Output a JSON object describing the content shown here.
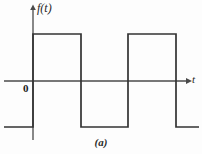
{
  "figure": {
    "caption": "(a)",
    "background_color": "#fdfdfd",
    "stroke_color": "#333333",
    "axis_color": "#4a4a4a",
    "width": 202,
    "height": 154
  },
  "axes": {
    "y_axis_label": "f(t)",
    "x_axis_label": "t",
    "origin_label": "0",
    "x_axis_y_px": 81,
    "y_axis_x_px": 33,
    "x_axis_start_px": 4,
    "x_axis_end_px": 188,
    "y_axis_top_px": 5,
    "y_axis_bottom_px": 140
  },
  "chart_data": {
    "type": "line",
    "title": "",
    "subtitle": "",
    "xlabel": "t",
    "ylabel": "f(t)",
    "legend": [],
    "legend_position": "none",
    "grid": false,
    "annotations": [
      "0",
      "(a)"
    ],
    "waveform": "square",
    "amplitude_high": 1,
    "amplitude_low": -1,
    "period_px": 95,
    "duty_cycle": 0.5,
    "xlim": [
      -0.35,
      1.8
    ],
    "ylim": [
      -1.5,
      1.5
    ],
    "x": [
      -0.35,
      0,
      0,
      0.5,
      0.5,
      1.0,
      1.0,
      1.5,
      1.5,
      1.8
    ],
    "values": [
      -1,
      -1,
      1,
      1,
      -1,
      -1,
      1,
      1,
      -1,
      -1
    ],
    "series": [
      {
        "name": "f(t)",
        "x": [
          -0.35,
          0,
          0,
          0.5,
          0.5,
          1.0,
          1.0,
          1.5,
          1.5,
          1.8
        ],
        "values": [
          -1,
          -1,
          1,
          1,
          -1,
          -1,
          1,
          1,
          -1,
          -1
        ]
      }
    ],
    "transitions_px": {
      "high_level_y": 34,
      "low_level_y": 127,
      "rise_1_x": 33,
      "fall_1_x": 81,
      "rise_2_x": 128,
      "fall_2_x": 176,
      "left_tail_start_x": 4,
      "right_tail_end_x": 199
    }
  }
}
